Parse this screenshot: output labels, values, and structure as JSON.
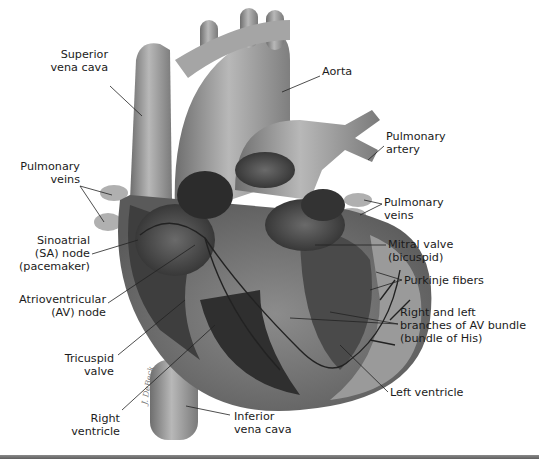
{
  "figure": {
    "signature": "J. DeBeck",
    "colors": {
      "background": "#ffffff",
      "vessel": "#9a9a9a",
      "shadow": "#3a3a3a",
      "pathway": "#222222",
      "text": "#1b1b1b"
    }
  },
  "labels": [
    {
      "id": "superior-vena-cava",
      "text": "Superior\nvena cava"
    },
    {
      "id": "aorta",
      "text": "Aorta"
    },
    {
      "id": "pulmonary-artery",
      "text": "Pulmonary\nartery"
    },
    {
      "id": "pulmonary-veins-left",
      "text": "Pulmonary\nveins"
    },
    {
      "id": "pulmonary-veins-right",
      "text": "Pulmonary\nveins"
    },
    {
      "id": "sa-node",
      "text": "Sinoatrial\n(SA) node\n(pacemaker)"
    },
    {
      "id": "mitral-valve",
      "text": "Mitral valve\n(bicuspid)"
    },
    {
      "id": "purkinje-fibers",
      "text": "Purkinje fibers"
    },
    {
      "id": "av-node",
      "text": "Atrioventricular\n(AV) node"
    },
    {
      "id": "av-bundle",
      "text": "Right and left\nbranches of AV bundle\n(bundle of His)"
    },
    {
      "id": "tricuspid-valve",
      "text": "Tricuspid\nvalve"
    },
    {
      "id": "left-ventricle",
      "text": "Left ventricle"
    },
    {
      "id": "right-ventricle",
      "text": "Right\nventricle"
    },
    {
      "id": "inferior-vena-cava",
      "text": "Inferior\nvena cava"
    }
  ]
}
